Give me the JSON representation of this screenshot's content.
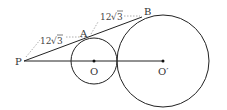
{
  "diagram": {
    "type": "geometry",
    "points": {
      "P": {
        "label": "P",
        "x": 24,
        "y": 61
      },
      "A": {
        "label": "A",
        "x": 88,
        "y": 39
      },
      "B": {
        "label": "B",
        "x": 142,
        "y": 17
      },
      "O": {
        "label": "O",
        "x": 94,
        "y": 61
      },
      "O_prime": {
        "label": "O′",
        "x": 163,
        "y": 61
      }
    },
    "circles": [
      {
        "name": "small-circle",
        "center": "O",
        "radius": 23
      },
      {
        "name": "large-circle",
        "center": "O_prime",
        "radius": 46
      }
    ],
    "segments": [
      {
        "name": "tangent-line-PB",
        "from": "P",
        "to": "B",
        "style": "solid"
      },
      {
        "name": "center-line-PO'",
        "from": "P",
        "to": "O_prime",
        "style": "solid"
      }
    ],
    "dimensions": [
      {
        "name": "PA-length",
        "label": "12√3",
        "text_main": "12",
        "text_root": "3"
      },
      {
        "name": "AB-length",
        "label": "12√3",
        "text_main": "12",
        "text_root": "3"
      }
    ],
    "colors": {
      "stroke": "#222222",
      "dotted": "#999999",
      "background": "#ffffff"
    }
  }
}
